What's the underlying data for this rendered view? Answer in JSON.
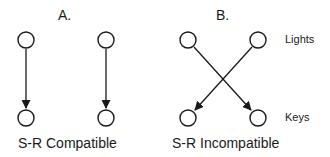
{
  "panels": [
    {
      "id": "A",
      "label": "A.",
      "caption": "S-R Compatible",
      "mapping": [
        {
          "from": "light-left",
          "to": "key-left"
        },
        {
          "from": "light-right",
          "to": "key-right"
        }
      ]
    },
    {
      "id": "B",
      "label": "B.",
      "caption": "S-R Incompatible",
      "mapping": [
        {
          "from": "light-left",
          "to": "key-right"
        },
        {
          "from": "light-right",
          "to": "key-left"
        }
      ]
    }
  ],
  "row_labels": {
    "top": "Lights",
    "bottom": "Keys"
  },
  "colors": {
    "stroke": "#1a1a1a",
    "background": "#ffffff"
  }
}
